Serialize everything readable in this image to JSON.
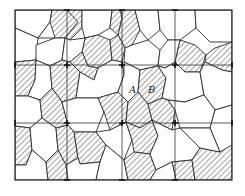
{
  "figure": {
    "labels": {
      "a": "A",
      "b": "B"
    },
    "colors": {
      "line": "#2a2a2a",
      "background": "#ffffff"
    },
    "frame": {
      "x0": 15,
      "y0": 10,
      "x1": 232,
      "y1": 180
    },
    "grid": {
      "vertical_x": [
        67,
        122,
        175
      ],
      "horizontal_y": [
        65,
        123
      ]
    }
  }
}
